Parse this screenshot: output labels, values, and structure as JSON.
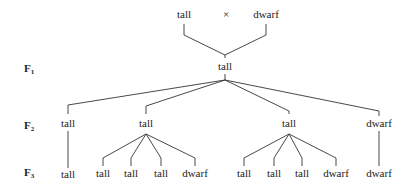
{
  "cross": {
    "parent_left": "tall",
    "symbol": "×",
    "parent_right": "dwarf"
  },
  "generations": [
    {
      "label": "F",
      "sub": "1"
    },
    {
      "label": "F",
      "sub": "2"
    },
    {
      "label": "F",
      "sub": "3"
    }
  ],
  "f1": {
    "label": "tall"
  },
  "f2": [
    {
      "label": "tall",
      "offspring": [
        "tall"
      ]
    },
    {
      "label": "tall",
      "offspring": [
        "tall",
        "tall",
        "tall",
        "dwarf"
      ]
    },
    {
      "label": "tall",
      "offspring": [
        "tall",
        "tall",
        "tall",
        "dwarf"
      ]
    },
    {
      "label": "dwarf",
      "offspring": [
        "dwarf"
      ]
    }
  ]
}
